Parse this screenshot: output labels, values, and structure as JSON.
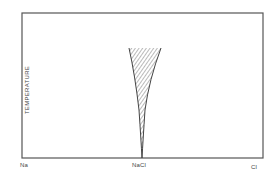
{
  "diagram": {
    "type": "phase-diagram",
    "y_axis_label": "TEMPERATURE",
    "x_axis_labels": {
      "left": "Na",
      "center": "NaCl",
      "right": "Cl"
    },
    "region": {
      "description": "hatched narrow homogeneity range of NaCl widening with temperature",
      "fill": "diagonal hatching"
    },
    "colors": {
      "frame": "#555555",
      "hatch": "#666666",
      "text": "#444444",
      "background": "#ffffff"
    }
  }
}
